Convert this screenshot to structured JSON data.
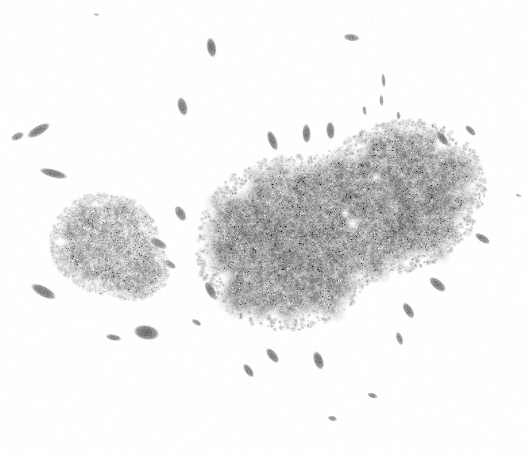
{
  "image": {
    "kind": "microscopy-grayscale-field",
    "title": "Grayscale micrograph of two granular colony masses with scattered rod-shaped particles",
    "width": 527,
    "height": 454,
    "background_color": "#ffffff",
    "has_text_labels": false,
    "has_scale_bar": false,
    "has_axes": false,
    "colorspace": "grayscale"
  },
  "palette": {
    "background": "#ffffff",
    "mass_light": "#c9c9c9",
    "mass_mid": "#a8a8a8",
    "mass_dark": "#8a8a8a",
    "speck_dark": "#4a4a4a",
    "speck_black": "#2a2a2a",
    "rod_fill": "#9a9a9a",
    "rod_core": "#6f6f6f",
    "highlight": "#ffffff"
  },
  "masses": [
    {
      "name": "large-colony-mass",
      "shape": "dumbbell",
      "lobes": [
        {
          "cx": 288,
          "cy": 243,
          "rx": 82,
          "ry": 77,
          "rot": -22
        },
        {
          "cx": 398,
          "cy": 196,
          "rx": 78,
          "ry": 66,
          "rot": -22
        },
        {
          "cx": 343,
          "cy": 219,
          "rx": 72,
          "ry": 62,
          "rot": -22
        }
      ],
      "mean_gray": "#a2a2a2",
      "bbox": [
        205,
        120,
        305,
        230
      ],
      "highlight_spots": [
        {
          "cx": 352,
          "cy": 223,
          "r": 11
        },
        {
          "cx": 345,
          "cy": 213,
          "r": 6
        },
        {
          "cx": 375,
          "cy": 177,
          "r": 7
        }
      ]
    },
    {
      "name": "small-colony-mass",
      "shape": "round-lobed",
      "lobes": [
        {
          "cx": 105,
          "cy": 243,
          "rx": 48,
          "ry": 44,
          "rot": 8
        },
        {
          "cx": 131,
          "cy": 267,
          "rx": 33,
          "ry": 28,
          "rot": 8
        }
      ],
      "mean_gray": "#bcbcbc",
      "bbox": [
        55,
        198,
        120,
        105
      ],
      "highlight_spots": []
    }
  ],
  "rod_particles": [
    {
      "cx": 38,
      "cy": 130,
      "len": 24,
      "w": 9,
      "angle": -30,
      "gray": "#8f8f8f"
    },
    {
      "cx": 17,
      "cy": 136,
      "len": 13,
      "w": 7,
      "angle": -25,
      "gray": "#a0a0a0"
    },
    {
      "cx": 53,
      "cy": 173,
      "len": 27,
      "w": 8,
      "angle": 15,
      "gray": "#909090"
    },
    {
      "cx": 43,
      "cy": 291,
      "len": 26,
      "w": 10,
      "angle": 28,
      "gray": "#8b8b8b"
    },
    {
      "cx": 113,
      "cy": 337,
      "len": 15,
      "w": 6,
      "angle": 12,
      "gray": "#9a9a9a"
    },
    {
      "cx": 146,
      "cy": 332,
      "len": 24,
      "w": 14,
      "angle": 10,
      "gray": "#7f7f7f"
    },
    {
      "cx": 158,
      "cy": 243,
      "len": 18,
      "w": 8,
      "angle": 28,
      "gray": "#9d9d9d"
    },
    {
      "cx": 170,
      "cy": 264,
      "len": 12,
      "w": 6,
      "angle": 35,
      "gray": "#a5a5a5"
    },
    {
      "cx": 180,
      "cy": 213,
      "len": 16,
      "w": 9,
      "angle": 60,
      "gray": "#959595"
    },
    {
      "cx": 182,
      "cy": 106,
      "len": 18,
      "w": 9,
      "angle": 75,
      "gray": "#8e8e8e"
    },
    {
      "cx": 211,
      "cy": 47,
      "len": 19,
      "w": 9,
      "angle": 80,
      "gray": "#8a8a8a"
    },
    {
      "cx": 351,
      "cy": 37,
      "len": 15,
      "w": 7,
      "angle": 8,
      "gray": "#9c9c9c"
    },
    {
      "cx": 383,
      "cy": 80,
      "len": 13,
      "w": 4,
      "angle": 85,
      "gray": "#a8a8a8"
    },
    {
      "cx": 381,
      "cy": 100,
      "len": 11,
      "w": 4,
      "angle": 85,
      "gray": "#acacac"
    },
    {
      "cx": 364,
      "cy": 110,
      "len": 9,
      "w": 4,
      "angle": 80,
      "gray": "#b0b0b0"
    },
    {
      "cx": 398,
      "cy": 115,
      "len": 8,
      "w": 4,
      "angle": 82,
      "gray": "#aeaeae"
    },
    {
      "cx": 272,
      "cy": 140,
      "len": 20,
      "w": 8,
      "angle": 68,
      "gray": "#8d8d8d"
    },
    {
      "cx": 306,
      "cy": 133,
      "len": 18,
      "w": 8,
      "angle": 88,
      "gray": "#8b8b8b"
    },
    {
      "cx": 330,
      "cy": 130,
      "len": 17,
      "w": 8,
      "angle": 86,
      "gray": "#8e8e8e"
    },
    {
      "cx": 442,
      "cy": 138,
      "len": 16,
      "w": 7,
      "angle": 52,
      "gray": "#909090"
    },
    {
      "cx": 470,
      "cy": 130,
      "len": 13,
      "w": 6,
      "angle": 45,
      "gray": "#999999"
    },
    {
      "cx": 482,
      "cy": 238,
      "len": 16,
      "w": 7,
      "angle": 32,
      "gray": "#949494"
    },
    {
      "cx": 437,
      "cy": 284,
      "len": 19,
      "w": 9,
      "angle": 40,
      "gray": "#8c8c8c"
    },
    {
      "cx": 408,
      "cy": 310,
      "len": 17,
      "w": 8,
      "angle": 58,
      "gray": "#8f8f8f"
    },
    {
      "cx": 399,
      "cy": 338,
      "len": 13,
      "w": 6,
      "angle": 70,
      "gray": "#9b9b9b"
    },
    {
      "cx": 318,
      "cy": 360,
      "len": 18,
      "w": 9,
      "angle": 70,
      "gray": "#8a8a8a"
    },
    {
      "cx": 272,
      "cy": 355,
      "len": 17,
      "w": 8,
      "angle": 52,
      "gray": "#8d8d8d"
    },
    {
      "cx": 248,
      "cy": 370,
      "len": 15,
      "w": 7,
      "angle": 55,
      "gray": "#959595"
    },
    {
      "cx": 210,
      "cy": 290,
      "len": 18,
      "w": 8,
      "angle": 62,
      "gray": "#909090"
    },
    {
      "cx": 196,
      "cy": 322,
      "len": 10,
      "w": 5,
      "angle": 30,
      "gray": "#a6a6a6"
    },
    {
      "cx": 372,
      "cy": 395,
      "len": 10,
      "w": 5,
      "angle": 20,
      "gray": "#a2a2a2"
    },
    {
      "cx": 332,
      "cy": 418,
      "len": 9,
      "w": 5,
      "angle": 15,
      "gray": "#a4a4a4"
    },
    {
      "cx": 96,
      "cy": 14,
      "len": 5,
      "w": 3,
      "angle": 0,
      "gray": "#c8c8c8"
    },
    {
      "cx": 518,
      "cy": 195,
      "len": 6,
      "w": 3,
      "angle": 20,
      "gray": "#c0c0c0"
    }
  ],
  "texture": {
    "grain_density": 0.55,
    "dark_speck_count": 420,
    "grain_scale_px": 2
  }
}
